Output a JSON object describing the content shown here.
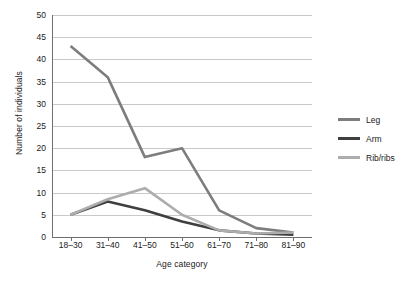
{
  "chart_data": {
    "type": "line",
    "title": "",
    "xlabel": "Age category",
    "ylabel": "Number of individuals",
    "categories": [
      "18–30",
      "31–40",
      "41–50",
      "51–60",
      "61–70",
      "71–80",
      "81–90"
    ],
    "ylim": [
      0,
      50
    ],
    "yticks": [
      0,
      5,
      10,
      15,
      20,
      25,
      30,
      35,
      40,
      45,
      50
    ],
    "grid": "horizontal",
    "legend_position": "right",
    "series": [
      {
        "name": "Leg",
        "color": "#7d7d7d",
        "values": [
          43,
          36,
          18,
          20,
          6,
          2,
          1
        ]
      },
      {
        "name": "Arm",
        "color": "#3f3f3f",
        "values": [
          5,
          8,
          6,
          3.5,
          1.5,
          0.8,
          0.5
        ]
      },
      {
        "name": "Rib/ribs",
        "color": "#adadad",
        "values": [
          5,
          8.5,
          11,
          5,
          1.5,
          0.8,
          1
        ]
      }
    ]
  },
  "legend": {
    "entries": [
      {
        "label": "Leg"
      },
      {
        "label": "Arm"
      },
      {
        "label": "Rib/ribs"
      }
    ]
  },
  "axes": {
    "y_title": "Number of individuals",
    "x_title": "Age category",
    "y_tick_labels": [
      "50",
      "45",
      "40",
      "35",
      "30",
      "25",
      "20",
      "15",
      "10",
      "5",
      "0"
    ],
    "x_tick_labels": [
      "18–30",
      "31–40",
      "41–50",
      "51–60",
      "61–70",
      "71–80",
      "81–90"
    ]
  }
}
